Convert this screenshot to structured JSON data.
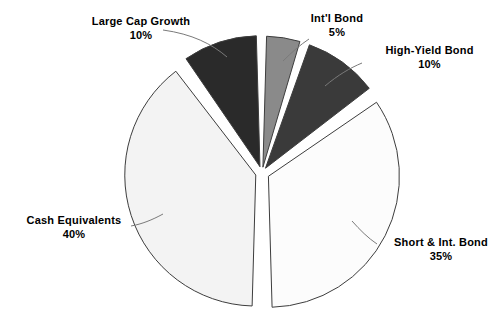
{
  "chart_data": {
    "type": "pie",
    "title": "",
    "subtitle": "",
    "xlabel": "",
    "ylabel": "",
    "legend_position": "none",
    "grid": false,
    "exploded": true,
    "value_unit": "%",
    "categories": [
      "Int'l Bond",
      "High-Yield Bond",
      "Short & Int. Bond",
      "Cash Equivalents",
      "Large Cap Growth"
    ],
    "values": [
      5,
      10,
      35,
      40,
      10
    ],
    "slices": [
      {
        "id": "intl-bond",
        "label": "Int'l Bond",
        "value": 5,
        "value_text": "5%",
        "color": "#8a8a8a",
        "start_angle_deg": 0,
        "end_angle_deg": 18,
        "explode": 0.045
      },
      {
        "id": "high-yield-bond",
        "label": "High-Yield Bond",
        "value": 10,
        "value_text": "10%",
        "color": "#3a3a3a",
        "start_angle_deg": 18,
        "end_angle_deg": 54,
        "explode": 0.045
      },
      {
        "id": "short-int-bond",
        "label": "Short & Int. Bond",
        "value": 35,
        "value_text": "35%",
        "color": "#fcfcfc",
        "start_angle_deg": 54,
        "end_angle_deg": 180,
        "explode": 0.055
      },
      {
        "id": "cash-equivalents",
        "label": "Cash Equivalents",
        "value": 40,
        "value_text": "40%",
        "color": "#f3f3f3",
        "start_angle_deg": 180,
        "end_angle_deg": 324,
        "explode": 0.05
      },
      {
        "id": "large-cap-growth",
        "label": "Large Cap Growth",
        "value": 10,
        "value_text": "10%",
        "color": "#2a2a2a",
        "start_angle_deg": 324,
        "end_angle_deg": 360,
        "explode": 0.05
      }
    ],
    "geometry": {
      "center_x": 262,
      "center_y": 173,
      "radius": 131
    },
    "style": {
      "background": "#ffffff",
      "outline_color": "#3d3d3d",
      "leader_line_color": "#7a7a7a",
      "label_color": "#000000"
    }
  },
  "labels": {
    "intl_bond": {
      "name": "Int'l Bond",
      "value": "5%"
    },
    "high_yield_bond": {
      "name": "High-Yield Bond",
      "value": "10%"
    },
    "short_int_bond": {
      "name": "Short & Int. Bond",
      "value": "35%"
    },
    "cash_equivalents": {
      "name": "Cash Equivalents",
      "value": "40%"
    },
    "large_cap_growth": {
      "name": "Large Cap Growth",
      "value": "10%"
    }
  }
}
